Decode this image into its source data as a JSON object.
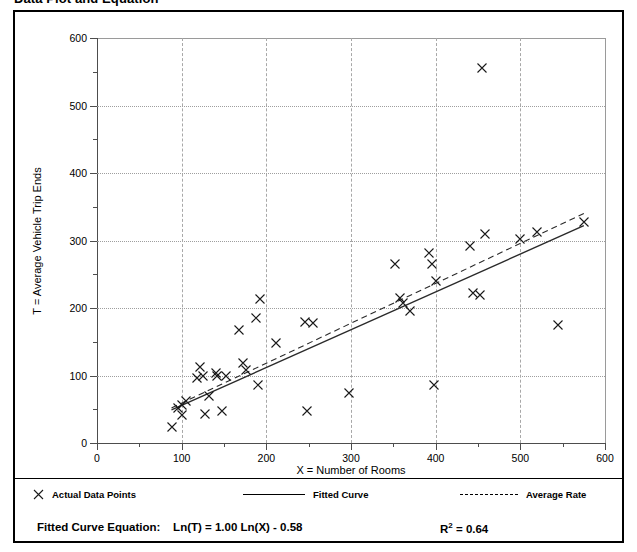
{
  "title": "Data Plot and Equation",
  "legend": {
    "actual_points": "Actual Data Points",
    "fitted_curve": "Fitted Curve",
    "average_rate": "Average Rate"
  },
  "equation": {
    "label": "Fitted Curve Equation:",
    "expression": "Ln(T) = 1.00 Ln(X) - 0.58",
    "r_squared_symbol": "R",
    "r_squared_exp": "2",
    "r_squared_value": "= 0.64"
  },
  "chart_data": {
    "type": "scatter",
    "title": "Data Plot and Equation",
    "xlabel": "X = Number of Rooms",
    "ylabel": "T = Average Vehicle Trip Ends",
    "xlim": [
      0,
      600
    ],
    "ylim": [
      0,
      600
    ],
    "xticks": [
      0,
      100,
      200,
      300,
      400,
      500,
      600
    ],
    "yticks": [
      0,
      100,
      200,
      300,
      400,
      500,
      600
    ],
    "xminor_step": 50,
    "yminor_step": 50,
    "grid": true,
    "legend_position": "below-plot",
    "marker": "x",
    "series": [
      {
        "name": "Actual Data Points",
        "type": "scatter",
        "points": [
          [
            88,
            23
          ],
          [
            96,
            52
          ],
          [
            100,
            57
          ],
          [
            100,
            42
          ],
          [
            105,
            62
          ],
          [
            118,
            96
          ],
          [
            122,
            113
          ],
          [
            125,
            100
          ],
          [
            128,
            43
          ],
          [
            132,
            70
          ],
          [
            140,
            104
          ],
          [
            142,
            100
          ],
          [
            148,
            47
          ],
          [
            152,
            100
          ],
          [
            168,
            167
          ],
          [
            172,
            118
          ],
          [
            176,
            108
          ],
          [
            188,
            185
          ],
          [
            190,
            86
          ],
          [
            192,
            213
          ],
          [
            212,
            148
          ],
          [
            246,
            180
          ],
          [
            248,
            48
          ],
          [
            255,
            178
          ],
          [
            298,
            74
          ],
          [
            352,
            265
          ],
          [
            358,
            215
          ],
          [
            362,
            208
          ],
          [
            370,
            196
          ],
          [
            392,
            281
          ],
          [
            396,
            265
          ],
          [
            398,
            86
          ],
          [
            400,
            240
          ],
          [
            440,
            292
          ],
          [
            444,
            222
          ],
          [
            452,
            220
          ],
          [
            455,
            555
          ],
          [
            458,
            310
          ],
          [
            500,
            302
          ],
          [
            520,
            312
          ],
          [
            545,
            175
          ],
          [
            575,
            328
          ]
        ]
      },
      {
        "name": "Fitted Curve",
        "type": "line",
        "style": "solid",
        "equation": "Ln(T) = 1.00 Ln(X) - 0.58",
        "r_squared": 0.64,
        "points": [
          [
            88,
            49
          ],
          [
            575,
            322
          ]
        ]
      },
      {
        "name": "Average Rate",
        "type": "line",
        "style": "dashed",
        "points": [
          [
            88,
            52
          ],
          [
            575,
            340
          ]
        ]
      }
    ]
  }
}
